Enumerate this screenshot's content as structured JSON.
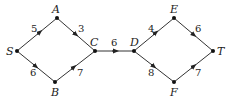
{
  "diagram": {
    "type": "directed-weighted-graph",
    "nodes": [
      {
        "id": "S",
        "label": "S",
        "x": 17,
        "y": 51
      },
      {
        "id": "A",
        "label": "A",
        "x": 57,
        "y": 18
      },
      {
        "id": "B",
        "label": "B",
        "x": 55,
        "y": 82
      },
      {
        "id": "C",
        "label": "C",
        "x": 95,
        "y": 51
      },
      {
        "id": "D",
        "label": "D",
        "x": 134,
        "y": 51
      },
      {
        "id": "E",
        "label": "E",
        "x": 174,
        "y": 18
      },
      {
        "id": "F",
        "label": "F",
        "x": 174,
        "y": 82
      },
      {
        "id": "T",
        "label": "T",
        "x": 213,
        "y": 51
      }
    ],
    "edges": [
      {
        "from": "S",
        "to": "A",
        "weight": "5"
      },
      {
        "from": "S",
        "to": "B",
        "weight": "6"
      },
      {
        "from": "A",
        "to": "C",
        "weight": "3"
      },
      {
        "from": "B",
        "to": "C",
        "weight": "7"
      },
      {
        "from": "C",
        "to": "D",
        "weight": "6"
      },
      {
        "from": "D",
        "to": "E",
        "weight": "4"
      },
      {
        "from": "D",
        "to": "F",
        "weight": "8"
      },
      {
        "from": "E",
        "to": "T",
        "weight": "6"
      },
      {
        "from": "F",
        "to": "T",
        "weight": "7"
      }
    ]
  }
}
